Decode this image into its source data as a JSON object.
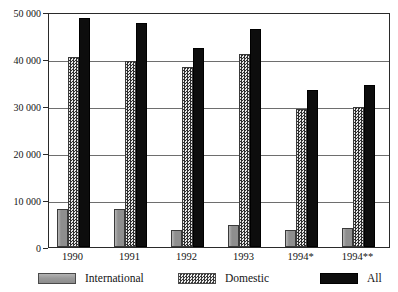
{
  "chart_data": {
    "type": "bar",
    "title": "",
    "subtitle": "",
    "xlabel": "",
    "ylabel": "",
    "ylim": [
      0,
      50000
    ],
    "ytick_values": [
      0,
      10000,
      20000,
      30000,
      40000,
      50000
    ],
    "ytick_labels": [
      "0",
      "10 000",
      "20 000",
      "30 000",
      "40 000",
      "50 000"
    ],
    "grid": true,
    "legend_position": "bottom",
    "categories": [
      "1990",
      "1991",
      "1992",
      "1993",
      "1994*",
      "1994**"
    ],
    "series": [
      {
        "name": "International",
        "color": "#8e8e8e",
        "pattern": "solid-gray",
        "values": [
          8100,
          8000,
          3600,
          4700,
          3600,
          4100
        ]
      },
      {
        "name": "Domestic",
        "color": "#c9c9c9",
        "pattern": "fine-checker",
        "values": [
          40400,
          39500,
          38300,
          41000,
          29300,
          29700
        ]
      },
      {
        "name": "All",
        "color": "#0d0d0d",
        "pattern": "solid-black",
        "values": [
          48700,
          47700,
          42300,
          46300,
          33400,
          34500
        ]
      }
    ]
  },
  "legend": {
    "items": [
      {
        "label": "International",
        "swatch": "swatch-international"
      },
      {
        "label": "Domestic",
        "swatch": "swatch-domestic"
      },
      {
        "label": "All",
        "swatch": "swatch-all"
      }
    ]
  }
}
